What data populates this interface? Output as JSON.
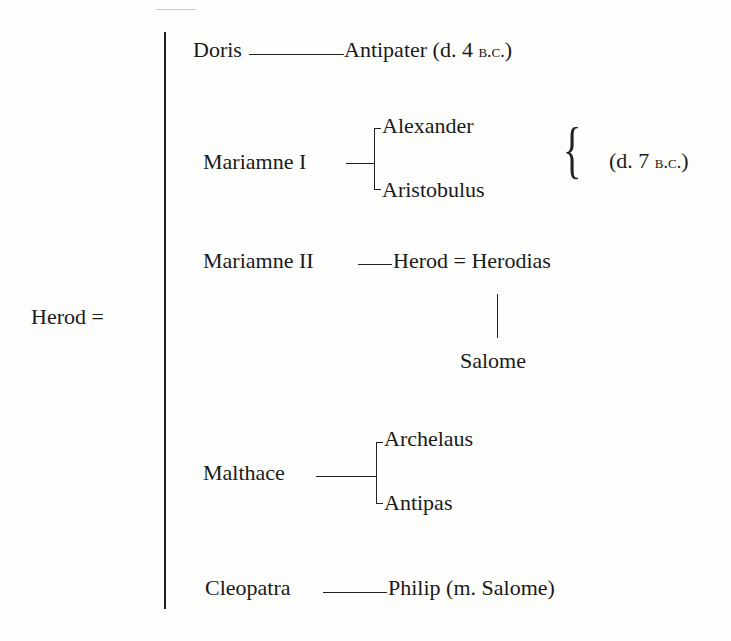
{
  "page": {
    "top_fragment": "",
    "root": {
      "name": "Herod",
      "sign": "="
    },
    "wives": [
      {
        "name": "Doris",
        "connector": "dash-long",
        "children": [
          {
            "name": "Antipater",
            "note_open": "(d. 4 ",
            "note_sc": "b.c.",
            "note_close": ")"
          }
        ]
      },
      {
        "name": "Mariamne I",
        "connector": "dash",
        "children": [
          {
            "name": "Alexander"
          },
          {
            "name": "Aristobulus"
          }
        ],
        "group_note": {
          "open": "(d. 7 ",
          "sc": "b.c.",
          "close": ")"
        }
      },
      {
        "name": "Mariamne II",
        "connector": "dash",
        "children": [
          {
            "name": "Herod",
            "spouse_sign": "=",
            "spouse": "Herodias",
            "child": "Salome"
          }
        ]
      },
      {
        "name": "Malthace",
        "connector": "dash-long",
        "children": [
          {
            "name": "Archelaus"
          },
          {
            "name": "Antipas"
          }
        ]
      },
      {
        "name": "Cleopatra",
        "connector": "dash-long",
        "children": [
          {
            "name": "Philip",
            "note": "(m. Salome)"
          }
        ]
      }
    ]
  }
}
